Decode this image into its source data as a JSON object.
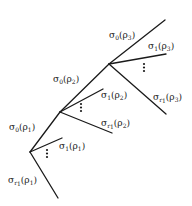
{
  "diagram": {
    "type": "branching-tree",
    "junctions": [
      {
        "id": "rho1",
        "label_up": "σ0(ρ1)",
        "label_branch1": "σ1(ρ1)",
        "label_branchr": "σr1(ρ1)"
      },
      {
        "id": "rho2",
        "label_up": "σ0(ρ2)",
        "label_branch1": "σ1(ρ2)",
        "label_branchr": "σr1(ρ2)"
      },
      {
        "id": "rho3",
        "label_up": "σ0(ρ3)",
        "label_branch1": "σ1(ρ3)",
        "label_branchr": "σr1(ρ3)"
      }
    ],
    "labels": {
      "s0p3": {
        "sym": "σ",
        "sub": "0",
        "arg": "(ρ",
        "argsub": "3",
        "close": ")"
      },
      "s1p3": {
        "sym": "σ",
        "sub": "1",
        "arg": "(ρ",
        "argsub": "3",
        "close": ")"
      },
      "sr1p3": {
        "sym": "σ",
        "sub": "r",
        "subsub": "1",
        "arg": "(ρ",
        "argsub": "3",
        "close": ")"
      },
      "s0p2": {
        "sym": "σ",
        "sub": "0",
        "arg": "(ρ",
        "argsub": "2",
        "close": ")"
      },
      "s1p2": {
        "sym": "σ",
        "sub": "1",
        "arg": "(ρ",
        "argsub": "2",
        "close": ")"
      },
      "sr1p2": {
        "sym": "σ",
        "sub": "r",
        "subsub": "1",
        "arg": "(ρ",
        "argsub": "2",
        "close": ")"
      },
      "s0p1": {
        "sym": "σ",
        "sub": "0",
        "arg": "(ρ",
        "argsub": "1",
        "close": ")"
      },
      "s1p1": {
        "sym": "σ",
        "sub": "1",
        "arg": "(ρ",
        "argsub": "1",
        "close": ")"
      },
      "sr1p1": {
        "sym": "σ",
        "sub": "r",
        "subsub": "1",
        "arg": "(ρ",
        "argsub": "1",
        "close": ")"
      }
    }
  }
}
